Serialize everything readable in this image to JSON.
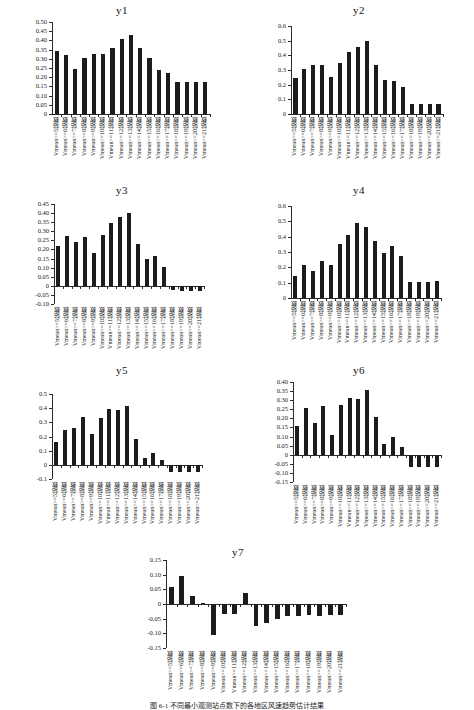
{
  "page": {
    "caption": "图 6-1 不同最小观测站点数下的各地区风速趋势估计结果"
  },
  "categories": [
    "Vmean>=5站数",
    "Vmean>=6站数",
    "Vmean>=7站数",
    "Vmean>=8站数",
    "Vmean>=9站数",
    "Vmean>=10站数",
    "Vmean>=11站数",
    "Vmean>=12站数",
    "Vmean>=13站数",
    "Vmean>=14站数",
    "Vmean>=15站数",
    "Vmean>=16站数",
    "Vmean>=17站数",
    "Vmean>=18站数",
    "Vmean>=19站数",
    "Vmean>=20站数",
    "Vmean>=21站数"
  ],
  "chart_data": [
    {
      "type": "bar",
      "title": "y1",
      "xlabel": "",
      "ylabel": "",
      "ylim": [
        0,
        0.5
      ],
      "ytick_step": 0.05,
      "ytick_labels": [
        "0.50",
        "0.45",
        "0.40",
        "0.35",
        "0.30",
        "0.25",
        "0.20",
        "0.15",
        "0.10",
        "0.05",
        "0"
      ],
      "grid": false,
      "legend": "none",
      "categories": [
        "Vmean>=5站数",
        "Vmean>=6站数",
        "Vmean>=7站数",
        "Vmean>=8站数",
        "Vmean>=9站数",
        "Vmean>=10站数",
        "Vmean>=11站数",
        "Vmean>=12站数",
        "Vmean>=13站数",
        "Vmean>=14站数",
        "Vmean>=15站数",
        "Vmean>=16站数",
        "Vmean>=17站数",
        "Vmean>=18站数",
        "Vmean>=19站数",
        "Vmean>=20站数",
        "Vmean>=21站数"
      ],
      "values": [
        0.342,
        0.323,
        0.245,
        0.307,
        0.327,
        0.327,
        0.36,
        0.409,
        0.432,
        0.36,
        0.307,
        0.238,
        0.225,
        0.175,
        0.175,
        0.175,
        0.174
      ]
    },
    {
      "type": "bar",
      "title": "y2",
      "xlabel": "",
      "ylabel": "",
      "ylim": [
        0,
        0.6
      ],
      "ytick_step": 0.1,
      "ytick_labels": [
        "0.6",
        "0.5",
        "0.4",
        "0.3",
        "0.2",
        "0.1",
        "0"
      ],
      "grid": false,
      "legend": "none",
      "categories": [
        "Vmean>=5站数",
        "Vmean>=6站数",
        "Vmean>=7站数",
        "Vmean>=8站数",
        "Vmean>=9站数",
        "Vmean>=10站数",
        "Vmean>=11站数",
        "Vmean>=12站数",
        "Vmean>=13站数",
        "Vmean>=14站数",
        "Vmean>=15站数",
        "Vmean>=16站数",
        "Vmean>=17站数",
        "Vmean>=18站数",
        "Vmean>=19站数",
        "Vmean>=20站数",
        "Vmean>=21站数"
      ],
      "values": [
        0.243,
        0.31,
        0.334,
        0.335,
        0.254,
        0.351,
        0.425,
        0.455,
        0.495,
        0.334,
        0.229,
        0.228,
        0.185,
        0.07,
        0.069,
        0.07,
        0.071
      ]
    },
    {
      "type": "bar",
      "title": "y3",
      "xlabel": "",
      "ylabel": "",
      "ylim": [
        -0.1,
        0.45
      ],
      "ytick_step": 0.05,
      "ytick_labels": [
        "0.45",
        "0.40",
        "0.35",
        "0.30",
        "0.25",
        "0.20",
        "0.15",
        "0.10",
        "0.05",
        "0",
        "-0.05",
        "-0.10"
      ],
      "grid": false,
      "legend": "none",
      "categories": [
        "Vmean>=5站数",
        "Vmean>=6站数",
        "Vmean>=7站数",
        "Vmean>=8站数",
        "Vmean>=9站数",
        "Vmean>=10站数",
        "Vmean>=11站数",
        "Vmean>=12站数",
        "Vmean>=13站数",
        "Vmean>=14站数",
        "Vmean>=15站数",
        "Vmean>=16站数",
        "Vmean>=17站数",
        "Vmean>=18站数",
        "Vmean>=19站数",
        "Vmean>=20站数",
        "Vmean>=21站数"
      ],
      "values": [
        0.217,
        0.272,
        0.24,
        0.267,
        0.182,
        0.281,
        0.348,
        0.381,
        0.401,
        0.229,
        0.146,
        0.163,
        0.104,
        -0.024,
        -0.026,
        -0.026,
        -0.026
      ]
    },
    {
      "type": "bar",
      "title": "y4",
      "xlabel": "",
      "ylabel": "",
      "ylim": [
        0,
        0.6
      ],
      "ytick_step": 0.1,
      "ytick_labels": [
        "0.6",
        "0.5",
        "0.4",
        "0.3",
        "0.2",
        "0.1",
        "0"
      ],
      "grid": false,
      "legend": "none",
      "categories": [
        "Vmean>=5站数",
        "Vmean>=6站数",
        "Vmean>=7站数",
        "Vmean>=8站数",
        "Vmean>=9站数",
        "Vmean>=10站数",
        "Vmean>=11站数",
        "Vmean>=12站数",
        "Vmean>=13站数",
        "Vmean>=14站数",
        "Vmean>=15站数",
        "Vmean>=16站数",
        "Vmean>=17站数",
        "Vmean>=18站数",
        "Vmean>=19站数",
        "Vmean>=20站数",
        "Vmean>=21站数"
      ],
      "values": [
        0.143,
        0.216,
        0.176,
        0.243,
        0.212,
        0.354,
        0.412,
        0.489,
        0.462,
        0.371,
        0.296,
        0.337,
        0.272,
        0.107,
        0.107,
        0.107,
        0.108
      ]
    },
    {
      "type": "bar",
      "title": "y5",
      "xlabel": "",
      "ylabel": "",
      "ylim": [
        -0.1,
        0.5
      ],
      "ytick_step": 0.1,
      "ytick_labels": [
        "0.5",
        "0.4",
        "0.3",
        "0.2",
        "0.1",
        "0",
        "-0.1"
      ],
      "grid": false,
      "legend": "none",
      "categories": [
        "Vmean>=5站数",
        "Vmean>=6站数",
        "Vmean>=7站数",
        "Vmean>=8站数",
        "Vmean>=9站数",
        "Vmean>=10站数",
        "Vmean>=11站数",
        "Vmean>=12站数",
        "Vmean>=13站数",
        "Vmean>=14站数",
        "Vmean>=15站数",
        "Vmean>=16站数",
        "Vmean>=17站数",
        "Vmean>=18站数",
        "Vmean>=19站数",
        "Vmean>=20站数",
        "Vmean>=21站数"
      ],
      "values": [
        0.158,
        0.248,
        0.26,
        0.336,
        0.216,
        0.33,
        0.394,
        0.385,
        0.414,
        0.18,
        0.048,
        0.085,
        0.036,
        -0.048,
        -0.048,
        -0.048,
        -0.048
      ]
    },
    {
      "type": "bar",
      "title": "y6",
      "xlabel": "",
      "ylabel": "",
      "ylim": [
        -0.15,
        0.4
      ],
      "ytick_step": 0.05,
      "ytick_labels": [
        "0.40",
        "0.35",
        "0.30",
        "0.25",
        "0.20",
        "0.15",
        "0.10",
        "0.05",
        "0",
        "-0.05",
        "-0.10",
        "-0.15"
      ],
      "grid": false,
      "legend": "none",
      "categories": [
        "Vmean>=5站数",
        "Vmean>=6站数",
        "Vmean>=7站数",
        "Vmean>=8站数",
        "Vmean>=9站数",
        "Vmean>=10站数",
        "Vmean>=11站数",
        "Vmean>=12站数",
        "Vmean>=13站数",
        "Vmean>=14站数",
        "Vmean>=15站数",
        "Vmean>=16站数",
        "Vmean>=17站数",
        "Vmean>=18站数",
        "Vmean>=19站数",
        "Vmean>=20站数",
        "Vmean>=21站数"
      ],
      "values": [
        0.16,
        0.257,
        0.176,
        0.27,
        0.11,
        0.272,
        0.313,
        0.306,
        0.358,
        0.205,
        0.058,
        0.096,
        0.04,
        -0.07,
        -0.07,
        -0.07,
        -0.07
      ]
    },
    {
      "type": "bar",
      "title": "y7",
      "xlabel": "",
      "ylabel": "",
      "ylim": [
        -0.15,
        0.15
      ],
      "ytick_step": 0.05,
      "ytick_labels": [
        "0.15",
        "0.10",
        "0.05",
        "0",
        "-0.05",
        "-0.10",
        "-0.15"
      ],
      "grid": false,
      "legend": "none",
      "categories": [
        "Vmean>=5站数",
        "Vmean>=6站数",
        "Vmean>=7站数",
        "Vmean>=8站数",
        "Vmean>=9站数",
        "Vmean>=10站数",
        "Vmean>=11站数",
        "Vmean>=12站数",
        "Vmean>=13站数",
        "Vmean>=14站数",
        "Vmean>=15站数",
        "Vmean>=16站数",
        "Vmean>=17站数",
        "Vmean>=18站数",
        "Vmean>=19站数",
        "Vmean>=20站数",
        "Vmean>=21站数"
      ],
      "values": [
        0.059,
        0.097,
        0.027,
        0.003,
        -0.106,
        -0.035,
        -0.033,
        0.039,
        -0.074,
        -0.066,
        -0.05,
        -0.042,
        -0.04,
        -0.039,
        -0.04,
        -0.038,
        -0.037
      ]
    }
  ],
  "layout": {
    "panels": [
      {
        "id": "y1",
        "left": 8,
        "top": 4,
        "width": 228,
        "height": 178,
        "plot_left": 44,
        "plot_top": 18,
        "plot_width": 158,
        "plot_height": 92
      },
      {
        "id": "y2",
        "left": 245,
        "top": 4,
        "width": 228,
        "height": 178,
        "plot_left": 46,
        "plot_top": 22,
        "plot_width": 152,
        "plot_height": 88
      },
      {
        "id": "y3",
        "left": 8,
        "top": 184,
        "width": 228,
        "height": 180,
        "plot_left": 46,
        "plot_top": 20,
        "plot_width": 150,
        "plot_height": 100
      },
      {
        "id": "y4",
        "left": 245,
        "top": 184,
        "width": 228,
        "height": 180,
        "plot_left": 46,
        "plot_top": 22,
        "plot_width": 150,
        "plot_height": 92
      },
      {
        "id": "y5",
        "left": 8,
        "top": 364,
        "width": 228,
        "height": 180,
        "plot_left": 44,
        "plot_top": 30,
        "plot_width": 150,
        "plot_height": 85
      },
      {
        "id": "y6",
        "left": 245,
        "top": 364,
        "width": 228,
        "height": 180,
        "plot_left": 48,
        "plot_top": 18,
        "plot_width": 148,
        "plot_height": 100
      },
      {
        "id": "y7",
        "left": 118,
        "top": 546,
        "width": 240,
        "height": 150,
        "plot_left": 48,
        "plot_top": 14,
        "plot_width": 180,
        "plot_height": 88
      }
    ]
  }
}
